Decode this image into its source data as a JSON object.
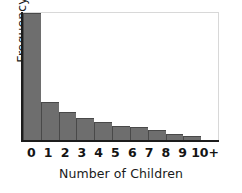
{
  "chart_data": {
    "type": "bar",
    "title": "",
    "subtitle": "",
    "xlabel": "Number of Children",
    "ylabel": "Frequency",
    "categories": [
      "0",
      "1",
      "2",
      "3",
      "4",
      "5",
      "6",
      "7",
      "8",
      "9",
      "10+"
    ],
    "values": [
      100,
      30,
      22,
      17,
      14,
      11,
      10,
      8,
      5,
      3,
      0
    ],
    "ylim": [
      0,
      100
    ],
    "grid": false,
    "legend": null,
    "annotations": [],
    "bar_color": "#6e6e6e",
    "bar_edge_color": "#494949",
    "axis_color": "#1c1c1c",
    "background_color": "#ffffff"
  }
}
